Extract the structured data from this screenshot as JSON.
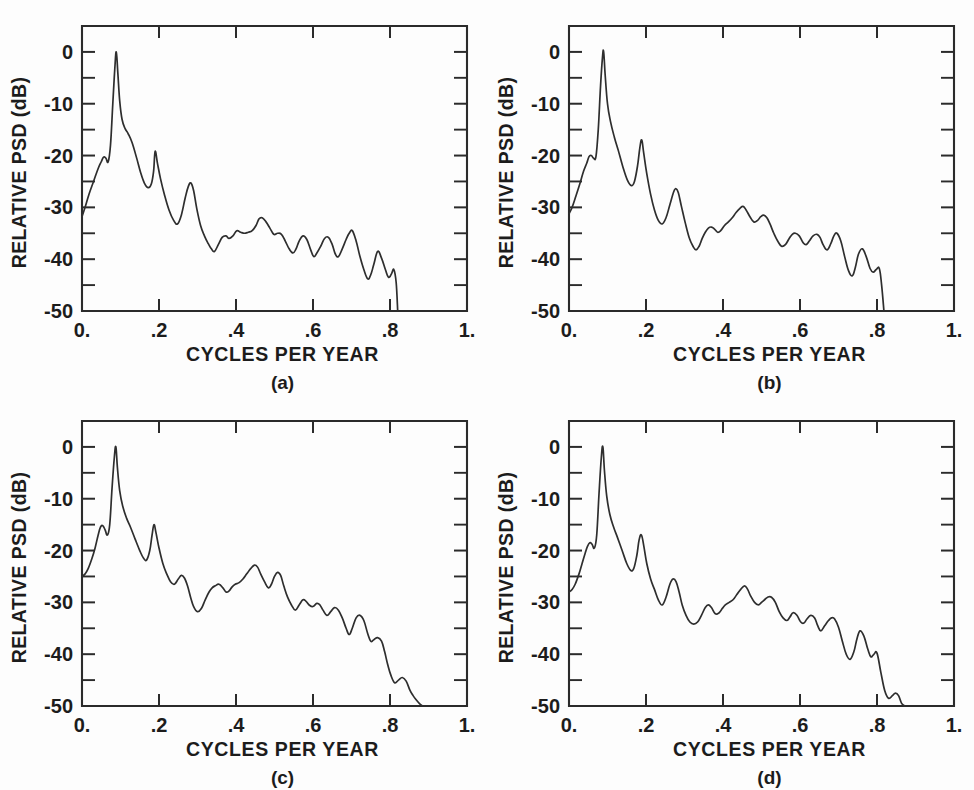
{
  "figure": {
    "background_color": "#fdfdfd",
    "ink_color": "#2b2b2b",
    "panel_count": 4
  },
  "axes_common": {
    "xlabel": "CYCLES PER YEAR",
    "ylabel": "RELATIVE PSD  (dB)",
    "xlim": [
      0.0,
      1.0
    ],
    "ylim": [
      -50,
      5
    ],
    "x_tick_labels": [
      "0.",
      ".2",
      ".4",
      ".6",
      ".8",
      "1."
    ],
    "x_tick_values": [
      0.0,
      0.2,
      0.4,
      0.6,
      0.8,
      1.0
    ],
    "y_tick_labels": [
      "0",
      "-10",
      "-20",
      "-30",
      "-40",
      "-50"
    ],
    "y_tick_values": [
      0,
      -10,
      -20,
      -30,
      -40,
      -50
    ],
    "y_minor_tick_values": [
      -5,
      -15,
      -25,
      -35,
      -45
    ],
    "grid": false,
    "legend": "none",
    "tick_direction": "inward"
  },
  "panels": [
    {
      "id": "a",
      "caption": "(a)"
    },
    {
      "id": "b",
      "caption": "(b)"
    },
    {
      "id": "c",
      "caption": "(c)"
    },
    {
      "id": "d",
      "caption": "(d)"
    }
  ],
  "chart_data": [
    {
      "type": "line",
      "title": "(a)",
      "xlabel": "CYCLES PER YEAR",
      "ylabel": "RELATIVE PSD  (dB)",
      "xlim": [
        0.0,
        1.0
      ],
      "ylim": [
        -50,
        5
      ],
      "grid": false,
      "legend": "none",
      "series": [
        {
          "name": "relative PSD (a)",
          "x": [
            0.0,
            0.008,
            0.018,
            0.03,
            0.042,
            0.05,
            0.056,
            0.062,
            0.068,
            0.074,
            0.08,
            0.085,
            0.089,
            0.093,
            0.098,
            0.104,
            0.112,
            0.12,
            0.13,
            0.142,
            0.152,
            0.162,
            0.172,
            0.18,
            0.186,
            0.19,
            0.196,
            0.204,
            0.214,
            0.226,
            0.238,
            0.248,
            0.258,
            0.268,
            0.276,
            0.283,
            0.29,
            0.298,
            0.308,
            0.318,
            0.328,
            0.336,
            0.344,
            0.354,
            0.364,
            0.374,
            0.382,
            0.392,
            0.402,
            0.412,
            0.422,
            0.432,
            0.442,
            0.452,
            0.46,
            0.468,
            0.478,
            0.488,
            0.498,
            0.508,
            0.518,
            0.528,
            0.538,
            0.548,
            0.556,
            0.564,
            0.574,
            0.584,
            0.594,
            0.602,
            0.61,
            0.62,
            0.63,
            0.64,
            0.65,
            0.658,
            0.666,
            0.676,
            0.686,
            0.694,
            0.702,
            0.712,
            0.722,
            0.732,
            0.742,
            0.75,
            0.758,
            0.768,
            0.778,
            0.788,
            0.796,
            0.804,
            0.81,
            0.816,
            0.82
          ],
          "y": [
            -31.8,
            -30.0,
            -27.5,
            -25.0,
            -22.5,
            -21.2,
            -20.3,
            -20.5,
            -21.2,
            -18.0,
            -10.0,
            -3.5,
            0.0,
            -4.0,
            -9.5,
            -13.0,
            -14.8,
            -15.8,
            -17.5,
            -20.5,
            -23.2,
            -25.3,
            -26.2,
            -25.5,
            -23.0,
            -19.2,
            -21.5,
            -24.5,
            -27.5,
            -30.5,
            -32.5,
            -33.2,
            -31.5,
            -28.2,
            -26.0,
            -25.3,
            -26.8,
            -30.2,
            -33.5,
            -35.5,
            -37.0,
            -38.0,
            -38.5,
            -37.2,
            -35.8,
            -35.5,
            -36.0,
            -35.5,
            -34.5,
            -34.8,
            -35.0,
            -34.8,
            -34.5,
            -33.5,
            -32.2,
            -32.0,
            -32.8,
            -34.0,
            -35.2,
            -35.0,
            -35.2,
            -36.5,
            -38.0,
            -38.8,
            -38.0,
            -36.5,
            -35.5,
            -36.2,
            -38.2,
            -39.5,
            -38.8,
            -37.5,
            -36.0,
            -35.8,
            -37.2,
            -39.0,
            -39.5,
            -38.0,
            -36.2,
            -35.0,
            -34.5,
            -36.5,
            -39.5,
            -42.0,
            -43.8,
            -43.0,
            -41.0,
            -38.5,
            -39.8,
            -42.0,
            -43.5,
            -42.8,
            -42.0,
            -44.5,
            -50.0
          ]
        }
      ]
    },
    {
      "type": "line",
      "title": "(b)",
      "xlabel": "CYCLES PER YEAR",
      "ylabel": "RELATIVE PSD  (dB)",
      "xlim": [
        0.0,
        1.0
      ],
      "ylim": [
        -50,
        5
      ],
      "grid": false,
      "legend": "none",
      "series": [
        {
          "name": "relative PSD (b)",
          "x": [
            0.0,
            0.008,
            0.018,
            0.028,
            0.038,
            0.046,
            0.052,
            0.058,
            0.064,
            0.07,
            0.076,
            0.082,
            0.087,
            0.09,
            0.094,
            0.1,
            0.108,
            0.118,
            0.128,
            0.14,
            0.152,
            0.162,
            0.17,
            0.178,
            0.184,
            0.189,
            0.194,
            0.202,
            0.212,
            0.222,
            0.232,
            0.242,
            0.252,
            0.262,
            0.272,
            0.278,
            0.284,
            0.292,
            0.302,
            0.312,
            0.322,
            0.33,
            0.338,
            0.346,
            0.354,
            0.362,
            0.37,
            0.378,
            0.386,
            0.394,
            0.404,
            0.414,
            0.424,
            0.434,
            0.444,
            0.452,
            0.46,
            0.47,
            0.48,
            0.49,
            0.498,
            0.506,
            0.514,
            0.522,
            0.532,
            0.542,
            0.552,
            0.562,
            0.572,
            0.58,
            0.588,
            0.598,
            0.608,
            0.616,
            0.624,
            0.634,
            0.644,
            0.652,
            0.66,
            0.67,
            0.68,
            0.688,
            0.696,
            0.706,
            0.716,
            0.726,
            0.736,
            0.744,
            0.752,
            0.762,
            0.772,
            0.782,
            0.79,
            0.798,
            0.806,
            0.812,
            0.818
          ],
          "y": [
            -31.2,
            -30.0,
            -27.8,
            -25.5,
            -23.0,
            -21.5,
            -20.2,
            -20.0,
            -20.5,
            -20.2,
            -15.0,
            -6.5,
            -1.0,
            0.0,
            -4.5,
            -10.0,
            -13.5,
            -16.5,
            -19.0,
            -22.2,
            -24.8,
            -25.8,
            -25.0,
            -22.0,
            -18.5,
            -17.0,
            -19.5,
            -23.5,
            -27.5,
            -30.5,
            -32.5,
            -33.2,
            -32.0,
            -29.5,
            -27.0,
            -26.4,
            -27.2,
            -29.8,
            -33.0,
            -35.8,
            -37.5,
            -38.2,
            -37.5,
            -36.0,
            -34.8,
            -34.0,
            -33.8,
            -34.2,
            -34.8,
            -34.5,
            -33.5,
            -32.8,
            -32.0,
            -31.0,
            -30.2,
            -29.8,
            -30.5,
            -31.8,
            -32.8,
            -32.5,
            -31.8,
            -31.5,
            -32.0,
            -33.2,
            -35.0,
            -36.5,
            -37.5,
            -37.2,
            -36.0,
            -35.2,
            -35.0,
            -35.5,
            -36.8,
            -37.2,
            -36.5,
            -35.5,
            -35.2,
            -35.8,
            -37.2,
            -38.2,
            -37.0,
            -35.5,
            -35.0,
            -36.5,
            -39.5,
            -42.2,
            -43.2,
            -41.5,
            -39.0,
            -38.0,
            -39.5,
            -41.8,
            -42.5,
            -42.0,
            -41.8,
            -45.0,
            -50.0
          ]
        }
      ]
    },
    {
      "type": "line",
      "title": "(c)",
      "xlabel": "CYCLES PER YEAR",
      "ylabel": "RELATIVE PSD  (dB)",
      "xlim": [
        0.0,
        1.0
      ],
      "ylim": [
        -50,
        5
      ],
      "grid": false,
      "legend": "none",
      "series": [
        {
          "name": "relative PSD (c)",
          "x": [
            0.0,
            0.008,
            0.016,
            0.026,
            0.034,
            0.042,
            0.048,
            0.054,
            0.06,
            0.066,
            0.072,
            0.078,
            0.084,
            0.088,
            0.092,
            0.098,
            0.106,
            0.116,
            0.126,
            0.138,
            0.15,
            0.16,
            0.168,
            0.176,
            0.182,
            0.187,
            0.192,
            0.2,
            0.21,
            0.22,
            0.23,
            0.24,
            0.25,
            0.258,
            0.266,
            0.274,
            0.282,
            0.29,
            0.3,
            0.31,
            0.32,
            0.33,
            0.338,
            0.346,
            0.356,
            0.366,
            0.374,
            0.382,
            0.39,
            0.398,
            0.408,
            0.418,
            0.428,
            0.438,
            0.448,
            0.456,
            0.464,
            0.474,
            0.484,
            0.492,
            0.5,
            0.508,
            0.516,
            0.524,
            0.534,
            0.544,
            0.554,
            0.564,
            0.574,
            0.582,
            0.59,
            0.6,
            0.61,
            0.618,
            0.626,
            0.636,
            0.646,
            0.656,
            0.666,
            0.676,
            0.686,
            0.694,
            0.702,
            0.712,
            0.722,
            0.732,
            0.742,
            0.75,
            0.758,
            0.768,
            0.778,
            0.786,
            0.794,
            0.802,
            0.812,
            0.822,
            0.832,
            0.842,
            0.852,
            0.86,
            0.868,
            0.876,
            0.884
          ],
          "y": [
            -25.0,
            -24.5,
            -23.5,
            -21.5,
            -19.5,
            -17.0,
            -15.5,
            -15.2,
            -16.0,
            -17.0,
            -15.0,
            -8.0,
            -2.0,
            0.0,
            -4.0,
            -8.5,
            -11.5,
            -13.8,
            -15.5,
            -17.8,
            -20.0,
            -21.5,
            -21.8,
            -20.0,
            -17.0,
            -15.0,
            -16.5,
            -19.5,
            -22.5,
            -24.5,
            -26.0,
            -26.5,
            -25.5,
            -24.8,
            -25.3,
            -26.8,
            -29.0,
            -30.8,
            -31.8,
            -31.2,
            -29.5,
            -28.0,
            -27.2,
            -26.8,
            -26.5,
            -27.2,
            -28.0,
            -27.8,
            -27.0,
            -26.5,
            -26.2,
            -25.5,
            -24.5,
            -23.5,
            -22.8,
            -23.2,
            -24.5,
            -26.0,
            -27.2,
            -26.5,
            -25.0,
            -24.2,
            -24.8,
            -26.8,
            -29.0,
            -30.5,
            -31.5,
            -30.5,
            -29.5,
            -29.8,
            -30.5,
            -30.8,
            -30.2,
            -30.5,
            -31.5,
            -32.5,
            -31.8,
            -31.0,
            -31.5,
            -33.0,
            -35.0,
            -36.2,
            -35.0,
            -33.0,
            -32.5,
            -33.5,
            -36.0,
            -37.5,
            -37.2,
            -36.8,
            -37.5,
            -39.5,
            -42.0,
            -44.0,
            -45.5,
            -45.0,
            -44.5,
            -45.2,
            -47.0,
            -48.0,
            -48.8,
            -49.5,
            -50.0
          ]
        }
      ]
    },
    {
      "type": "line",
      "title": "(d)",
      "xlabel": "CYCLES PER YEAR",
      "ylabel": "RELATIVE PSD  (dB)",
      "xlim": [
        0.0,
        1.0
      ],
      "ylim": [
        -50,
        5
      ],
      "grid": false,
      "legend": "none",
      "series": [
        {
          "name": "relative PSD (d)",
          "x": [
            0.0,
            0.008,
            0.016,
            0.026,
            0.034,
            0.042,
            0.048,
            0.054,
            0.06,
            0.066,
            0.072,
            0.078,
            0.084,
            0.088,
            0.092,
            0.098,
            0.106,
            0.116,
            0.126,
            0.138,
            0.15,
            0.16,
            0.168,
            0.176,
            0.182,
            0.188,
            0.194,
            0.202,
            0.212,
            0.222,
            0.232,
            0.242,
            0.252,
            0.262,
            0.27,
            0.278,
            0.286,
            0.294,
            0.304,
            0.314,
            0.324,
            0.334,
            0.344,
            0.354,
            0.362,
            0.37,
            0.38,
            0.39,
            0.398,
            0.406,
            0.416,
            0.426,
            0.436,
            0.446,
            0.456,
            0.464,
            0.472,
            0.482,
            0.492,
            0.5,
            0.508,
            0.516,
            0.526,
            0.536,
            0.546,
            0.556,
            0.566,
            0.574,
            0.582,
            0.592,
            0.602,
            0.61,
            0.618,
            0.628,
            0.638,
            0.646,
            0.654,
            0.664,
            0.674,
            0.682,
            0.69,
            0.7,
            0.71,
            0.72,
            0.73,
            0.74,
            0.748,
            0.756,
            0.766,
            0.776,
            0.784,
            0.792,
            0.8,
            0.81,
            0.82,
            0.83,
            0.84,
            0.848,
            0.856,
            0.864,
            0.872
          ],
          "y": [
            -28.0,
            -27.5,
            -26.5,
            -24.5,
            -22.5,
            -20.5,
            -19.2,
            -18.5,
            -18.8,
            -19.5,
            -17.0,
            -9.0,
            -2.0,
            0.0,
            -4.5,
            -9.5,
            -13.0,
            -15.5,
            -17.5,
            -20.0,
            -22.5,
            -23.8,
            -23.5,
            -21.0,
            -18.0,
            -17.0,
            -19.0,
            -22.5,
            -25.5,
            -27.5,
            -29.5,
            -30.5,
            -29.0,
            -26.5,
            -25.5,
            -26.0,
            -28.0,
            -30.5,
            -32.5,
            -33.8,
            -34.2,
            -33.8,
            -32.5,
            -31.0,
            -30.5,
            -31.0,
            -32.2,
            -32.0,
            -31.2,
            -30.5,
            -30.0,
            -29.5,
            -28.5,
            -27.5,
            -26.8,
            -27.5,
            -28.8,
            -30.0,
            -30.5,
            -30.0,
            -29.5,
            -29.0,
            -29.0,
            -30.0,
            -31.8,
            -33.0,
            -33.5,
            -32.8,
            -32.0,
            -32.5,
            -33.8,
            -34.0,
            -33.2,
            -32.5,
            -33.0,
            -34.5,
            -35.5,
            -34.5,
            -33.5,
            -33.0,
            -33.2,
            -34.8,
            -37.5,
            -40.0,
            -41.0,
            -39.5,
            -37.0,
            -35.5,
            -36.5,
            -39.0,
            -40.5,
            -40.0,
            -39.8,
            -43.5,
            -47.0,
            -48.5,
            -48.0,
            -47.5,
            -48.0,
            -49.5,
            -50.0
          ]
        }
      ]
    }
  ]
}
